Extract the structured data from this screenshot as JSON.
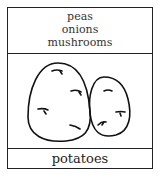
{
  "card": {
    "ingredients": [
      "peas",
      "onions",
      "mushrooms"
    ],
    "illustration": "two potatoes",
    "label": "potatoes"
  }
}
